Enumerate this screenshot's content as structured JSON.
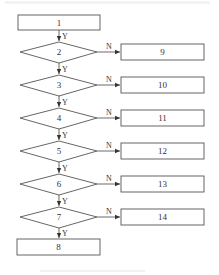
{
  "diagram": {
    "type": "flowchart",
    "start": {
      "id": "1",
      "label": "1"
    },
    "end": {
      "id": "8",
      "label": "8"
    },
    "decisions": [
      {
        "id": "2",
        "label": "2",
        "yes_label": "Y",
        "no_label": "N",
        "no_target": "9"
      },
      {
        "id": "3",
        "label": "3",
        "yes_label": "Y",
        "no_label": "N",
        "no_target": "10"
      },
      {
        "id": "4",
        "label": "4",
        "yes_label": "Y",
        "no_label": "N",
        "no_target": "11"
      },
      {
        "id": "5",
        "label": "5",
        "yes_label": "Y",
        "no_label": "N",
        "no_target": "12"
      },
      {
        "id": "6",
        "label": "6",
        "yes_label": "Y",
        "no_label": "N",
        "no_target": "13"
      },
      {
        "id": "7",
        "label": "7",
        "yes_label": "Y",
        "no_label": "N",
        "no_target": "14"
      }
    ],
    "outcomes": [
      {
        "id": "9",
        "label": "9"
      },
      {
        "id": "10",
        "label": "10"
      },
      {
        "id": "11",
        "label": "11"
      },
      {
        "id": "12",
        "label": "12"
      },
      {
        "id": "13",
        "label": "13"
      },
      {
        "id": "14",
        "label": "14"
      }
    ],
    "entry_yes_label": "Y",
    "final_yes_label": "Y"
  },
  "colors": {
    "stroke": "#555555",
    "text": "#333333",
    "background": "#ffffff"
  }
}
